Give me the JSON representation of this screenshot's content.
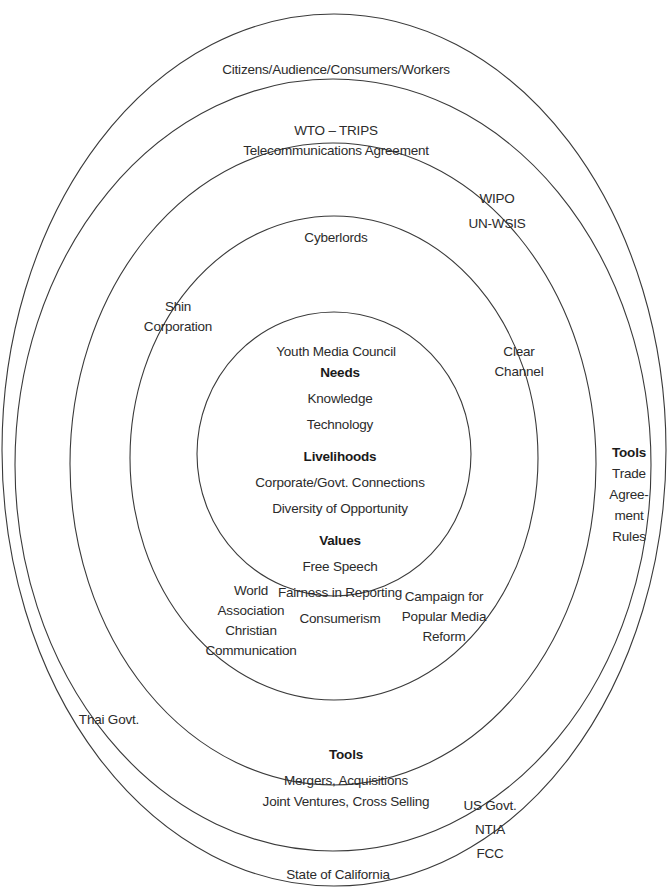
{
  "diagram": {
    "type": "concentric-ellipses",
    "stroke_color": "#3a3a3a",
    "rings": [
      {
        "name": "core",
        "cx": 334,
        "cy": 454,
        "rx": 137,
        "ry": 142
      },
      {
        "name": "ring-1",
        "cx": 334,
        "cy": 458,
        "rx": 204,
        "ry": 242
      },
      {
        "name": "ring-2",
        "cx": 333,
        "cy": 464,
        "rx": 263,
        "ry": 321
      },
      {
        "name": "ring-3",
        "cx": 333,
        "cy": 465,
        "rx": 318,
        "ry": 386
      },
      {
        "name": "ring-4",
        "cx": 334,
        "cy": 450,
        "rx": 332,
        "ry": 436
      }
    ]
  },
  "core": {
    "needs": {
      "heading": "Needs",
      "items": [
        "Knowledge",
        "Technology"
      ]
    },
    "livelihoods": {
      "heading": "Livelihoods",
      "items": [
        "Corporate/Govt. Connections",
        "Diversity of Opportunity"
      ]
    },
    "values": {
      "heading": "Values",
      "items": [
        "Free Speech",
        "Fairness in Reporting",
        "Consumerism"
      ]
    }
  },
  "labels": {
    "citizens": "Citizens/Audience/Consumers/Workers",
    "wto": [
      "WTO – TRIPS",
      "Telecommunications Agreement"
    ],
    "wipo": [
      "WIPO",
      "UN-WSIS"
    ],
    "cyberlords": "Cyberlords",
    "shin": [
      "Shin",
      "Corporation"
    ],
    "youth": "Youth Media Council",
    "clear_channel": [
      "Clear",
      "Channel"
    ],
    "outer_tools": {
      "heading": "Tools",
      "items": [
        "Trade",
        "Agree-",
        "ment",
        "Rules"
      ]
    },
    "wacc": [
      "World",
      "Association",
      "Christian",
      "Communication"
    ],
    "campaign": [
      "Campaign for",
      "Popular Media",
      "Reform"
    ],
    "thai": "Thai Govt.",
    "inner_tools": {
      "heading": "Tools",
      "items": [
        "Mergers, Acquisitions",
        "Joint Ventures, Cross Selling"
      ]
    },
    "us_govt": [
      "US Govt.",
      "NTIA",
      "FCC"
    ],
    "california": "State of California"
  }
}
